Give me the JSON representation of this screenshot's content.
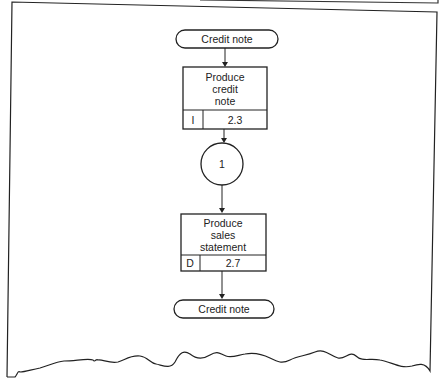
{
  "diagram": {
    "type": "flowchart",
    "colors": {
      "stroke": "#222222",
      "background": "#ffffff"
    },
    "nodes": {
      "start": {
        "shape": "terminator",
        "label": "Credit note"
      },
      "process1": {
        "shape": "process",
        "label_lines": [
          "Produce",
          "credit",
          "note"
        ],
        "code": "I",
        "ref": "2.3"
      },
      "connector": {
        "shape": "connector-circle",
        "label": "1"
      },
      "process2": {
        "shape": "process",
        "label_lines": [
          "Produce",
          "sales",
          "statement"
        ],
        "code": "D",
        "ref": "2.7"
      },
      "end": {
        "shape": "terminator",
        "label": "Credit note"
      }
    },
    "edges": [
      {
        "from": "start",
        "to": "process1"
      },
      {
        "from": "process1",
        "to": "connector"
      },
      {
        "from": "connector",
        "to": "process2"
      },
      {
        "from": "process2",
        "to": "end"
      }
    ]
  }
}
